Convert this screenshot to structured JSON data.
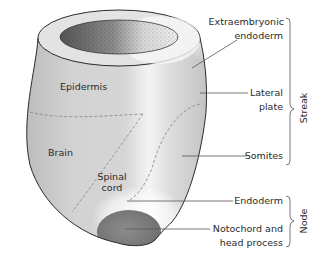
{
  "diagram": {
    "type": "embryo-fate-map",
    "colors": {
      "outline": "#2b2b2b",
      "body_fill": "#cfcfcf",
      "highlight": "#f7f7f7",
      "node_dark": "#8a8a8a",
      "leader_line": "#555555",
      "dashed_boundary": "#8c8c8c",
      "text": "#2a2a2a"
    },
    "region_labels": {
      "epidermis": "Epidermis",
      "brain": "Brain",
      "spinal_cord_line1": "Spinal",
      "spinal_cord_line2": "cord"
    },
    "callouts": {
      "extraembryonic_line1": "Extraembryonic",
      "extraembryonic_line2": "endoderm",
      "lateral_line1": "Lateral",
      "lateral_line2": "plate",
      "somites": "Somites",
      "endoderm": "Endoderm",
      "notochord_line1": "Notochord and",
      "notochord_line2": "head process"
    },
    "groups": {
      "streak": "Streak",
      "node": "Node"
    }
  }
}
